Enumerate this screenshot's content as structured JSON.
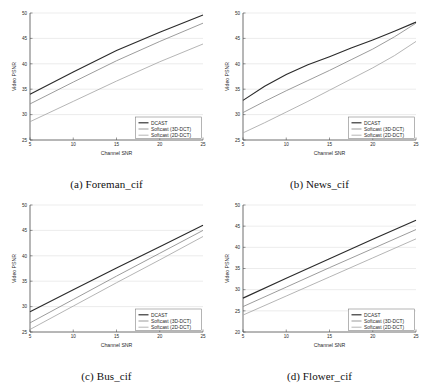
{
  "figure": {
    "panel_count": 4,
    "series_names": [
      "DCAST",
      "Softcast (3D-DCT)",
      "Softcast (2D-DCT)"
    ],
    "series_colors": [
      "#2b2b2b",
      "#8a8a8a",
      "#a8a8a8"
    ]
  },
  "panels": [
    {
      "caption": "(a) Foreman_cif",
      "legend": [
        "DCAST",
        "Softcast (3D-DCT)",
        "Softcast (2D-DCT)"
      ],
      "chart_data": {
        "type": "line",
        "title": "",
        "xlabel": "Channel SNR",
        "ylabel": "Video PSNR",
        "xlim": [
          5,
          25
        ],
        "ylim": [
          25,
          50
        ],
        "xticks": [
          5,
          10,
          15,
          20,
          25
        ],
        "yticks": [
          25,
          30,
          35,
          40,
          45,
          50
        ],
        "grid": true,
        "legend_position": "lower right",
        "x": [
          5,
          10,
          15,
          20,
          25
        ],
        "series": [
          {
            "name": "DCAST",
            "values": [
              34.0,
              38.4,
              42.6,
              46.2,
              49.6
            ]
          },
          {
            "name": "Softcast (3D-DCT)",
            "values": [
              32.1,
              36.4,
              40.6,
              44.4,
              48.0
            ]
          },
          {
            "name": "Softcast (2D-DCT)",
            "values": [
              28.6,
              32.6,
              36.6,
              40.4,
              43.9
            ]
          }
        ]
      }
    },
    {
      "caption": "(b) News_cif",
      "legend": [
        "DCAST",
        "Softcast (3D-DCT)",
        "Softcast (2D-DCT)"
      ],
      "chart_data": {
        "type": "line",
        "title": "",
        "xlabel": "Channel SNR",
        "ylabel": "Video PSNR",
        "xlim": [
          5,
          25
        ],
        "ylim": [
          25,
          50
        ],
        "xticks": [
          5,
          10,
          15,
          20,
          25
        ],
        "yticks": [
          25,
          30,
          35,
          40,
          45,
          50
        ],
        "grid": true,
        "legend_position": "lower right",
        "x": [
          5,
          7.5,
          10,
          12.5,
          15,
          17.5,
          20,
          22.5,
          25
        ],
        "series": [
          {
            "name": "DCAST",
            "values": [
              32.8,
              35.6,
              37.9,
              39.8,
              41.4,
              43.1,
              44.7,
              46.4,
              48.2
            ]
          },
          {
            "name": "Softcast (3D-DCT)",
            "values": [
              30.4,
              32.6,
              34.7,
              36.7,
              38.7,
              40.8,
              42.9,
              45.3,
              48.0
            ]
          },
          {
            "name": "Softcast (2D-DCT)",
            "values": [
              26.4,
              28.4,
              30.5,
              32.6,
              34.8,
              37.0,
              39.2,
              41.6,
              44.4
            ]
          }
        ]
      }
    },
    {
      "caption": "(c) Bus_cif",
      "legend": [
        "DCAST",
        "Softcast (3D-DCT)",
        "Softcast (2D-DCT)"
      ],
      "chart_data": {
        "type": "line",
        "title": "",
        "xlabel": "Channel SNR",
        "ylabel": "Video PSNR",
        "xlim": [
          5,
          25
        ],
        "ylim": [
          25,
          50
        ],
        "xticks": [
          5,
          10,
          15,
          20,
          25
        ],
        "yticks": [
          25,
          30,
          35,
          40,
          45,
          50
        ],
        "grid": true,
        "legend_position": "lower right",
        "x": [
          5,
          10,
          15,
          20,
          25
        ],
        "series": [
          {
            "name": "DCAST",
            "values": [
              29.0,
              33.3,
              37.6,
              41.8,
              46.0
            ]
          },
          {
            "name": "Softcast (3D-DCT)",
            "values": [
              26.8,
              31.4,
              36.0,
              40.5,
              45.0
            ]
          },
          {
            "name": "Softcast (2D-DCT)",
            "values": [
              25.5,
              30.1,
              34.7,
              39.2,
              43.8
            ]
          }
        ]
      }
    },
    {
      "caption": "(d) Flower_cif",
      "legend": [
        "DCAST",
        "Softcast (3D-DCT)",
        "Softcast (2D-DCT)"
      ],
      "chart_data": {
        "type": "line",
        "title": "",
        "xlabel": "Channel SNR",
        "ylabel": "Video PSNR",
        "xlim": [
          5,
          25
        ],
        "ylim": [
          20,
          50
        ],
        "xticks": [
          5,
          10,
          15,
          20,
          25
        ],
        "yticks": [
          20,
          25,
          30,
          35,
          40,
          45,
          50
        ],
        "grid": true,
        "legend_position": "lower right",
        "x": [
          5,
          10,
          15,
          20,
          25
        ],
        "series": [
          {
            "name": "DCAST",
            "values": [
              28.0,
              32.7,
              37.3,
              41.9,
              46.4
            ]
          },
          {
            "name": "Softcast (3D-DCT)",
            "values": [
              26.0,
              30.6,
              35.2,
              39.7,
              44.2
            ]
          },
          {
            "name": "Softcast (2D-DCT)",
            "values": [
              24.0,
              28.5,
              33.0,
              37.5,
              42.0
            ]
          }
        ]
      }
    }
  ]
}
